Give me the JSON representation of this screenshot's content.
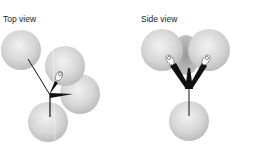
{
  "panels": [
    {
      "id": "top",
      "label": "Top view"
    },
    {
      "id": "side",
      "label": "Side view"
    }
  ],
  "colors": {
    "sphere_light": "#f0f0f0",
    "sphere_mid": "#d4d4d4",
    "sphere_dark": "#b8b8b8",
    "bond": "#111111",
    "text": "#1a1a1a",
    "background": "#ffffff"
  }
}
